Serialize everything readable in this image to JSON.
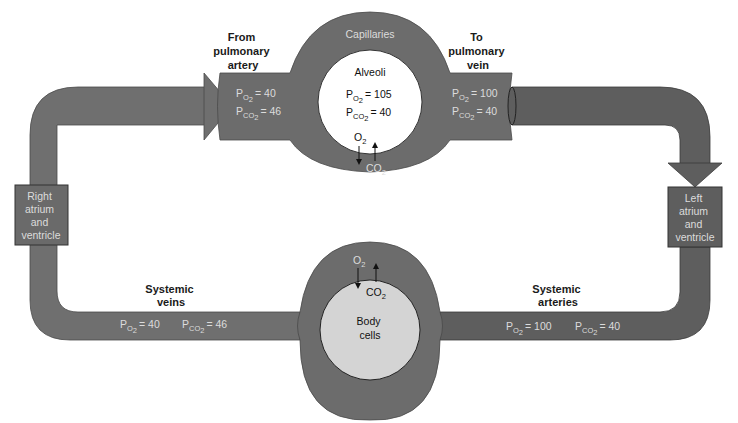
{
  "colors": {
    "vessel": "#6f6f6f",
    "vessel_dark": "#5a5a5a",
    "vessel_edge": "#3a3a3a",
    "alveoli_fill": "#ffffff",
    "body_cells_fill": "#d4d4d4",
    "light_text": "#dcdcdc",
    "dark_text": "#1a1a1a"
  },
  "pulmonary": {
    "capillaries_label": "Capillaries",
    "alveoli_label": "Alveoli",
    "alveoli_po2": {
      "symbol": "P",
      "sub": "O",
      "subsub": "2",
      "value": "= 105"
    },
    "alveoli_pco2": {
      "symbol": "P",
      "sub": "CO",
      "subsub": "2",
      "value": "= 40"
    },
    "o2_label": "O",
    "o2_sub": "2",
    "co2_label": "CO",
    "co2_sub": "2",
    "from_artery": {
      "label_lines": [
        "From",
        "pulmonary",
        "artery"
      ],
      "po2": "= 40",
      "pco2": "= 46"
    },
    "to_vein": {
      "label_lines": [
        "To",
        "pulmonary",
        "vein"
      ],
      "po2": "= 100",
      "pco2": "= 40"
    }
  },
  "heart": {
    "right": {
      "label_lines": [
        "Right",
        "atrium",
        "and",
        "ventricle"
      ]
    },
    "left": {
      "label_lines": [
        "Left",
        "atrium",
        "and",
        "ventricle"
      ]
    }
  },
  "systemic": {
    "body_cells_lines": [
      "Body",
      "cells"
    ],
    "o2_label": "O",
    "o2_sub": "2",
    "co2_label": "CO",
    "co2_sub": "2",
    "veins": {
      "label_lines": [
        "Systemic",
        "veins"
      ],
      "po2": "= 40",
      "pco2": "= 46"
    },
    "arteries": {
      "label_lines": [
        "Systemic",
        "arteries"
      ],
      "po2": "= 100",
      "pco2": "= 40"
    }
  },
  "p_symbol": "P",
  "o2_subscript": "O",
  "co2_subscript": "CO",
  "two": "2"
}
